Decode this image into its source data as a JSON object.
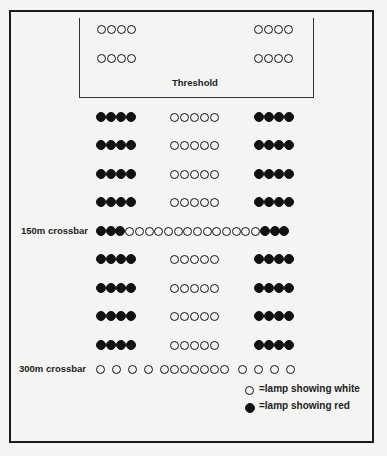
{
  "threshold": {
    "label": "Threshold",
    "rows": [
      {
        "y": 29,
        "groups": [
          {
            "x": 97,
            "count": 4,
            "color": "white"
          },
          {
            "x": 254,
            "count": 4,
            "color": "white"
          }
        ]
      },
      {
        "y": 58,
        "groups": [
          {
            "x": 97,
            "count": 4,
            "color": "white"
          },
          {
            "x": 254,
            "count": 4,
            "color": "white"
          }
        ]
      }
    ]
  },
  "rows": [
    {
      "y": 117,
      "groups": [
        {
          "x": 97,
          "count": 4,
          "color": "red"
        },
        {
          "x": 170,
          "count": 5,
          "color": "white"
        },
        {
          "x": 255,
          "count": 4,
          "color": "red"
        }
      ]
    },
    {
      "y": 145,
      "groups": [
        {
          "x": 97,
          "count": 4,
          "color": "red"
        },
        {
          "x": 170,
          "count": 5,
          "color": "white"
        },
        {
          "x": 255,
          "count": 4,
          "color": "red"
        }
      ]
    },
    {
      "y": 174,
      "groups": [
        {
          "x": 97,
          "count": 4,
          "color": "red"
        },
        {
          "x": 170,
          "count": 5,
          "color": "white"
        },
        {
          "x": 255,
          "count": 4,
          "color": "red"
        }
      ]
    },
    {
      "y": 202,
      "groups": [
        {
          "x": 97,
          "count": 4,
          "color": "red"
        },
        {
          "x": 170,
          "count": 5,
          "color": "white"
        },
        {
          "x": 255,
          "count": 4,
          "color": "red"
        }
      ]
    },
    {
      "y": 259,
      "groups": [
        {
          "x": 97,
          "count": 4,
          "color": "red"
        },
        {
          "x": 170,
          "count": 5,
          "color": "white"
        },
        {
          "x": 255,
          "count": 4,
          "color": "red"
        }
      ]
    },
    {
      "y": 288,
      "groups": [
        {
          "x": 97,
          "count": 4,
          "color": "red"
        },
        {
          "x": 170,
          "count": 5,
          "color": "white"
        },
        {
          "x": 255,
          "count": 4,
          "color": "red"
        }
      ]
    },
    {
      "y": 316,
      "groups": [
        {
          "x": 97,
          "count": 4,
          "color": "red"
        },
        {
          "x": 170,
          "count": 5,
          "color": "white"
        },
        {
          "x": 255,
          "count": 4,
          "color": "red"
        }
      ]
    },
    {
      "y": 345,
      "groups": [
        {
          "x": 97,
          "count": 4,
          "color": "red"
        },
        {
          "x": 170,
          "count": 5,
          "color": "white"
        },
        {
          "x": 255,
          "count": 4,
          "color": "red"
        }
      ]
    }
  ],
  "crossbar_150": {
    "label": "150m crossbar",
    "y": 231,
    "sequence": [
      "red",
      "red",
      "red",
      "white",
      "white",
      "white",
      "white",
      "white",
      "white",
      "white",
      "white",
      "white",
      "white",
      "white",
      "white",
      "white",
      "white",
      "red",
      "red",
      "red"
    ]
  },
  "crossbar_300": {
    "label": "300m crossbar",
    "y": 369,
    "positions": [
      100,
      116,
      132,
      148,
      164,
      174,
      184,
      194,
      204,
      214,
      224,
      242,
      258,
      274,
      290
    ]
  },
  "legend": {
    "white_label": "=lamp showing white",
    "red_label": "=lamp showing red"
  }
}
